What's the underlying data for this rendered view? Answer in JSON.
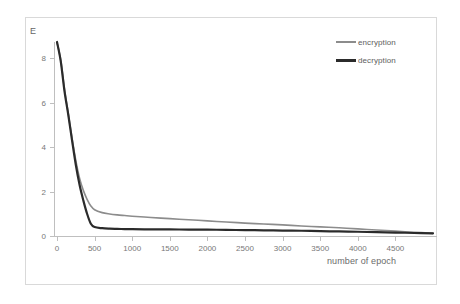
{
  "chart_data": {
    "type": "line",
    "title": "",
    "xlabel": "number of epoch",
    "ylabel": "E",
    "xlim": [
      0,
      5000
    ],
    "ylim": [
      0,
      9
    ],
    "grid": false,
    "legend_position": "top-right",
    "xticks": [
      "0",
      "500",
      "1000",
      "1500",
      "2000",
      "2500",
      "3000",
      "3500",
      "4000",
      "4500"
    ],
    "xtick_values": [
      0,
      500,
      1000,
      1500,
      2000,
      2500,
      3000,
      3500,
      4000,
      4500
    ],
    "yticks": [
      "0",
      "2",
      "4",
      "6",
      "8"
    ],
    "ytick_values": [
      0,
      2,
      4,
      6,
      8
    ],
    "x": [
      0,
      50,
      100,
      150,
      200,
      250,
      300,
      350,
      400,
      450,
      500,
      600,
      700,
      800,
      900,
      1000,
      1250,
      1500,
      1750,
      2000,
      2250,
      2500,
      2750,
      3000,
      3250,
      3500,
      3750,
      4000,
      4250,
      4500,
      4750,
      5000
    ],
    "series": [
      {
        "name": "encryption",
        "color": "#8c8c8c",
        "width": 1.6,
        "values": [
          8.7,
          7.9,
          6.6,
          5.5,
          4.4,
          3.4,
          2.6,
          2.05,
          1.65,
          1.35,
          1.18,
          1.05,
          0.99,
          0.95,
          0.92,
          0.89,
          0.83,
          0.78,
          0.73,
          0.68,
          0.63,
          0.58,
          0.54,
          0.5,
          0.45,
          0.41,
          0.37,
          0.32,
          0.27,
          0.22,
          0.17,
          0.12
        ]
      },
      {
        "name": "decryption",
        "color": "#2b2b2b",
        "width": 2.2,
        "values": [
          8.72,
          7.85,
          6.5,
          5.45,
          4.3,
          3.2,
          2.3,
          1.6,
          1.0,
          0.55,
          0.4,
          0.35,
          0.33,
          0.32,
          0.31,
          0.305,
          0.3,
          0.295,
          0.29,
          0.285,
          0.275,
          0.265,
          0.255,
          0.245,
          0.235,
          0.22,
          0.205,
          0.19,
          0.17,
          0.155,
          0.135,
          0.12
        ]
      }
    ]
  }
}
